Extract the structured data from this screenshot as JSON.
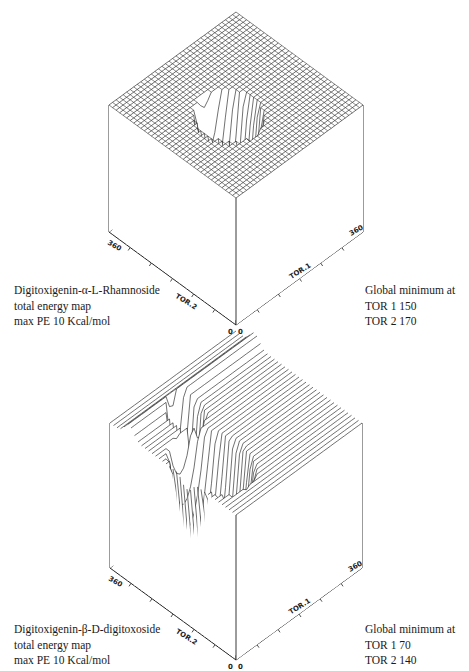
{
  "figures": [
    {
      "id": "rhamnoside",
      "caption_left": [
        "Digitoxigenin-α-L-Rhamnoside",
        "total energy map",
        "max PE 10 Kcal/mol"
      ],
      "caption_right": [
        "Global minimum at",
        "TOR 1 150",
        "TOR 2 170"
      ],
      "axes": {
        "x_label": "TOR.1",
        "y_label": "TOR.2",
        "x_max_tick": "360",
        "y_max_tick": "360",
        "origin_x": "0",
        "origin_y": "0"
      },
      "global_minimum": {
        "tor1": 150,
        "tor2": 170
      }
    },
    {
      "id": "digitoxoside",
      "caption_left": [
        "Digitoxigenin-β-D-digitoxoside",
        "total energy map",
        "max PE 10 Kcal/mol"
      ],
      "caption_right": [
        "Global minimum at",
        "TOR 1 70",
        "TOR 2 140"
      ],
      "axes": {
        "x_label": "TOR.1",
        "y_label": "TOR.2",
        "x_max_tick": "360",
        "y_max_tick": "360",
        "origin_x": "0",
        "origin_y": "0"
      },
      "global_minimum": {
        "tor1": 70,
        "tor2": 140
      }
    }
  ],
  "chart_data": [
    {
      "type": "surface",
      "title": "Digitoxigenin-α-L-Rhamnoside total energy map",
      "xlabel": "TOR.1",
      "ylabel": "TOR.2",
      "zlabel": "PE (Kcal/mol)",
      "xlim": [
        0,
        360
      ],
      "ylim": [
        0,
        360
      ],
      "zmax": 10,
      "global_minimum": {
        "TOR1": 150,
        "TOR2": 170
      }
    },
    {
      "type": "surface",
      "title": "Digitoxigenin-β-D-digitoxoside total energy map",
      "xlabel": "TOR.1",
      "ylabel": "TOR.2",
      "zlabel": "PE (Kcal/mol)",
      "xlim": [
        0,
        360
      ],
      "ylim": [
        0,
        360
      ],
      "zmax": 10,
      "global_minimum": {
        "TOR1": 70,
        "TOR2": 140
      }
    }
  ]
}
